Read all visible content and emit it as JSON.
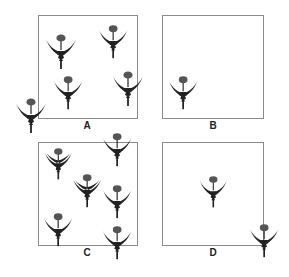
{
  "figure": {
    "colors": {
      "border": "#8a8a8a",
      "plant_head": "#555555",
      "plant_body": "#222222",
      "label": "#222222"
    },
    "panels": [
      {
        "id": "A",
        "label": "A",
        "box": [
          38,
          15,
          100,
          104
        ],
        "label_pos": [
          87,
          126
        ],
        "plants": [
          {
            "x": 61,
            "y": 38,
            "s": 1.0
          },
          {
            "x": 113,
            "y": 29,
            "s": 0.95
          },
          {
            "x": 68,
            "y": 80,
            "s": 0.95
          },
          {
            "x": 128,
            "y": 75,
            "s": 1.0
          },
          {
            "x": 31,
            "y": 102,
            "s": 1.0
          }
        ]
      },
      {
        "id": "B",
        "label": "B",
        "box": [
          162,
          15,
          102,
          104
        ],
        "label_pos": [
          213,
          126
        ],
        "plants": [
          {
            "x": 183,
            "y": 80,
            "s": 0.95
          }
        ]
      },
      {
        "id": "C",
        "label": "C",
        "box": [
          38,
          142,
          100,
          104
        ],
        "label_pos": [
          87,
          253
        ],
        "plants": [
          {
            "x": 58,
            "y": 151,
            "s": 0.9,
            "double": true
          },
          {
            "x": 117,
            "y": 137,
            "s": 0.95
          },
          {
            "x": 87,
            "y": 178,
            "s": 0.95,
            "double": true
          },
          {
            "x": 117,
            "y": 189,
            "s": 0.95
          },
          {
            "x": 58,
            "y": 217,
            "s": 0.95
          },
          {
            "x": 117,
            "y": 230,
            "s": 0.95
          }
        ]
      },
      {
        "id": "D",
        "label": "D",
        "box": [
          162,
          142,
          102,
          104
        ],
        "label_pos": [
          213,
          253
        ],
        "plants": [
          {
            "x": 213,
            "y": 179,
            "s": 0.9
          },
          {
            "x": 264,
            "y": 228,
            "s": 0.95
          }
        ]
      }
    ]
  }
}
